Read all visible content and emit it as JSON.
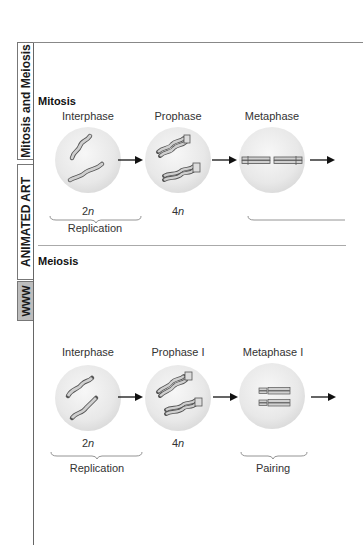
{
  "side_tab": {
    "title": "Mitosis and Meiosis",
    "category": "ANIMATED ART",
    "web_badge": "WWW"
  },
  "mitosis": {
    "title": "Mitosis",
    "stages": [
      {
        "label": "Interphase",
        "ploidy_num": "2",
        "ploidy_var": "n",
        "icon": "replicating-chromosomes-cell"
      },
      {
        "label": "Prophase",
        "ploidy_num": "4",
        "ploidy_var": "n",
        "icon": "condensed-chromosomes-cell"
      },
      {
        "label": "Metaphase",
        "ploidy_num": "",
        "ploidy_var": "",
        "icon": "aligned-chromosomes-cell"
      }
    ],
    "brackets": [
      {
        "label": "Replication"
      },
      {
        "label": ""
      }
    ]
  },
  "meiosis": {
    "title": "Meiosis",
    "stages": [
      {
        "label": "Interphase",
        "ploidy_num": "2",
        "ploidy_var": "n",
        "icon": "replicating-chromosomes-cell"
      },
      {
        "label": "Prophase I",
        "ploidy_num": "4",
        "ploidy_var": "n",
        "icon": "condensed-chromosomes-cell"
      },
      {
        "label": "Metaphase I",
        "ploidy_num": "",
        "ploidy_var": "",
        "icon": "paired-chromosomes-cell"
      }
    ],
    "brackets": [
      {
        "label": "Replication"
      },
      {
        "label": "Pairing"
      }
    ]
  },
  "colors": {
    "cell_fill": "#e6e6e6",
    "chromosome_fill": "#c8c8c8",
    "chromosome_stroke": "#555555",
    "arrow": "#111111",
    "frame": "#666666"
  }
}
